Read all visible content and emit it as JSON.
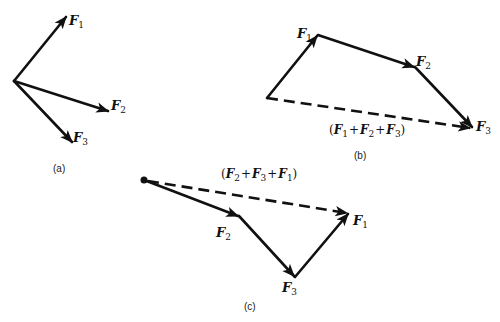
{
  "figure": {
    "panels": [
      {
        "id": "a",
        "caption": "(a)",
        "vectors": [
          {
            "name": "F",
            "sub": "1",
            "from": [
              14,
              81
            ],
            "to": [
              67,
              16
            ],
            "label_pos": [
              70,
              25
            ]
          },
          {
            "name": "F",
            "sub": "2",
            "from": [
              14,
              81
            ],
            "to": [
              109,
              111
            ],
            "label_pos": [
              111,
              110
            ]
          },
          {
            "name": "F",
            "sub": "3",
            "from": [
              14,
              81
            ],
            "to": [
              73,
              143
            ],
            "label_pos": [
              73,
              142
            ]
          }
        ]
      },
      {
        "id": "b",
        "caption": "(b)",
        "vectors": [
          {
            "name": "F",
            "sub": "1",
            "from": [
              267,
              98
            ],
            "to": [
              318,
              35
            ],
            "label_pos": [
              297,
              38
            ]
          },
          {
            "name": "F",
            "sub": "2",
            "from": [
              318,
              35
            ],
            "to": [
              415,
              67
            ],
            "label_pos": [
              416,
              66
            ]
          },
          {
            "name": "F",
            "sub": "3",
            "from": [
              415,
              67
            ],
            "to": [
              473,
              128
            ],
            "label_pos": [
              476,
              131
            ]
          }
        ],
        "resultant": {
          "from": [
            267,
            98
          ],
          "to": [
            473,
            128
          ],
          "style": "dashed"
        },
        "sum_label": {
          "open": "(",
          "terms": [
            "F",
            "1",
            "+",
            "F",
            "2",
            "+",
            "F",
            "3"
          ],
          "close": ")",
          "text": "(F1 + F2 + F3)"
        }
      },
      {
        "id": "c",
        "caption": "(c)",
        "origin_dot": [
          144,
          180
        ],
        "vectors": [
          {
            "name": "F",
            "sub": "2",
            "from": [
              144,
              180
            ],
            "to": [
              239,
              216
            ],
            "label_pos": [
              216,
              237
            ]
          },
          {
            "name": "F",
            "sub": "3",
            "from": [
              239,
              216
            ],
            "to": [
              295,
              277
            ],
            "label_pos": [
              282,
              293
            ]
          },
          {
            "name": "F",
            "sub": "1",
            "from": [
              295,
              277
            ],
            "to": [
              349,
              213
            ],
            "label_pos": [
              353,
              225
            ]
          }
        ],
        "resultant": {
          "from": [
            144,
            180
          ],
          "to": [
            349,
            213
          ],
          "style": "dashed"
        },
        "sum_label": {
          "text": "(F2 + F3 + F1)"
        }
      }
    ],
    "labels": {
      "F": "F",
      "plus": "+",
      "open_paren": "(",
      "close_paren": ")",
      "sub1": "1",
      "sub2": "2",
      "sub3": "3",
      "caption_a": "(a)",
      "caption_b": "(b)",
      "caption_c": "(c)"
    },
    "colors": {
      "ink": "#111111",
      "background": "#ffffff"
    }
  }
}
